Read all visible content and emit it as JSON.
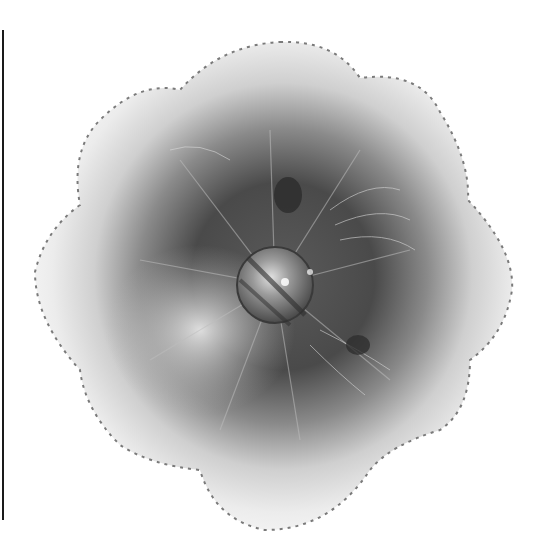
{
  "image": {
    "subject": "Scalloped glass bowl viewed from above",
    "description": "Grayscale photo of an eight-lobed ruffled glass bowl with crimped edge and pressed floral/feather pattern interior",
    "colors": {
      "background": "#ffffff",
      "rim_light": "#f2f2f2",
      "rim_mid": "#d4d4d4",
      "interior_dark": "#3c3c3c",
      "interior_mid": "#7a7a7a",
      "highlight": "#e8e8e8",
      "edge_crimp": "#6e6e6e",
      "frame_line": "#1a1a1a"
    },
    "lobes": 8
  }
}
